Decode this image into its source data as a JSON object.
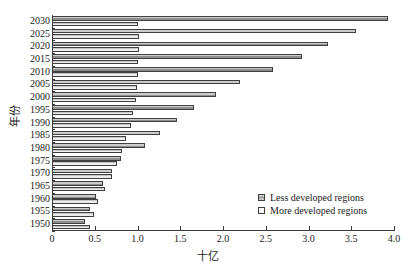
{
  "top_clipped_text": "",
  "chart_data": {
    "type": "bar",
    "orientation": "horizontal",
    "title": "",
    "xlabel": "十亿",
    "ylabel": "年份",
    "categories": [
      "1950",
      "1955",
      "1960",
      "1965",
      "1970",
      "1975",
      "1980",
      "1985",
      "1990",
      "1995",
      "2000",
      "2005",
      "2010",
      "2015",
      "2020",
      "2025",
      "2030"
    ],
    "series": [
      {
        "name": "Less developed regions",
        "color": "#8f8f8f",
        "values": [
          0.39,
          0.45,
          0.52,
          0.6,
          0.7,
          0.81,
          1.09,
          1.26,
          1.46,
          1.66,
          1.92,
          2.2,
          2.58,
          2.92,
          3.23,
          3.55,
          3.93
        ]
      },
      {
        "name": "More developed regions",
        "color": "#ededed",
        "values": [
          0.44,
          0.49,
          0.54,
          0.62,
          0.7,
          0.76,
          0.82,
          0.87,
          0.92,
          0.95,
          0.98,
          0.99,
          1.0,
          1.01,
          1.02,
          1.02,
          1.01
        ]
      }
    ],
    "xticks": [
      "0",
      "0.5",
      "1.0",
      "1.5",
      "2.0",
      "2.5",
      "3.0",
      "3.5",
      "4.0"
    ],
    "xtick_values": [
      0,
      0.5,
      1.0,
      1.5,
      2.0,
      2.5,
      3.0,
      3.5,
      4.0
    ],
    "xlim": [
      0,
      4.0
    ],
    "grid": false,
    "legend_position": "inside-lower-right",
    "legend": [
      "Less developed regions",
      "More developed regions"
    ]
  }
}
